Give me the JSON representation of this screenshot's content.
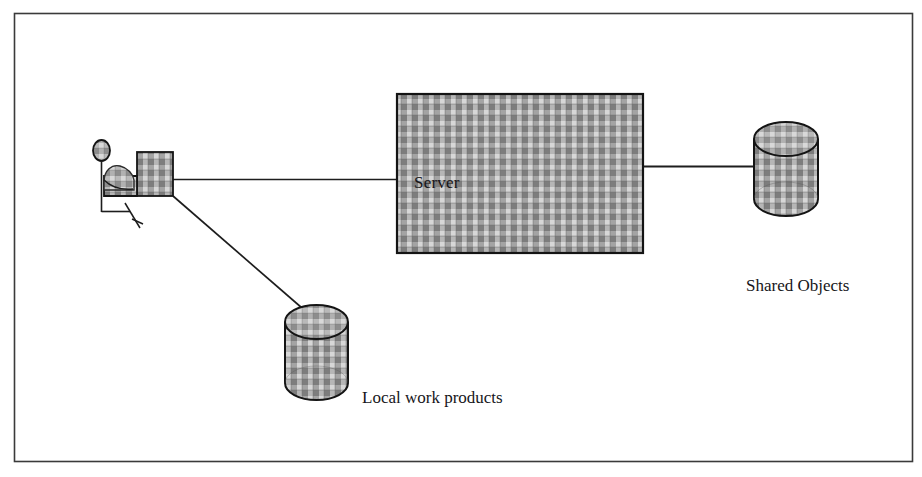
{
  "figure": {
    "type": "architecture-diagram",
    "background_color": "#ffffff",
    "border": {
      "present": true,
      "color": "#3a3a3a",
      "x": 14,
      "y": 13,
      "width": 899,
      "height": 449,
      "stroke_width": 1.6
    }
  },
  "palette": {
    "line_color": "#1d1d1d",
    "text_color": "#16161a",
    "hatch_light": "#c9c9c9",
    "hatch_mid": "#a8a8a8",
    "hatch_dark": "#7a7a7a",
    "shape_outline": "#141414",
    "frame_color": "#3a3a3a"
  },
  "nodes": [
    {
      "id": "workstation",
      "data_name": "workstation-user-figure",
      "kind": "actor-at-workstation",
      "label": "",
      "description": "Seated stick figure person at a desk with a computer terminal",
      "x": 88,
      "y": 140,
      "width": 90,
      "height": 100
    },
    {
      "id": "server",
      "data_name": "server-box",
      "kind": "rectangle",
      "label": "Server",
      "label_x": 414,
      "label_y": 187,
      "x": 397,
      "y": 94,
      "width": 246,
      "height": 159,
      "fill": "hatched-grey-plaid"
    },
    {
      "id": "shared-objects",
      "data_name": "shared-objects-cylinder",
      "kind": "cylinder",
      "label": "Shared Objects",
      "label_x": 746,
      "label_y": 290,
      "x": 754,
      "y": 122,
      "width": 64,
      "height": 94,
      "fill": "hatched-grey-plaid"
    },
    {
      "id": "local-work-products",
      "data_name": "local-work-products-cylinder",
      "kind": "cylinder",
      "label": "Local work products",
      "label_x": 362,
      "label_y": 402,
      "x": 285,
      "y": 305,
      "width": 63,
      "height": 95,
      "fill": "hatched-grey-plaid"
    }
  ],
  "connections": [
    {
      "id": "workstation-to-server",
      "data_name": "connector-workstation-server",
      "from": "workstation",
      "to": "server",
      "style": "solid-line",
      "x1": 172,
      "y1": 179,
      "x2": 397,
      "y2": 179
    },
    {
      "id": "server-to-shared-objects",
      "data_name": "connector-server-shared-objects",
      "from": "server",
      "to": "shared-objects",
      "style": "solid-line",
      "x1": 643,
      "y1": 166,
      "x2": 756,
      "y2": 166
    },
    {
      "id": "workstation-to-local",
      "data_name": "connector-workstation-local-products",
      "from": "workstation",
      "to": "local-work-products",
      "style": "solid-diagonal-line",
      "x1": 173,
      "y1": 196,
      "x2": 316,
      "y2": 320
    }
  ],
  "labels": {
    "server": "Server",
    "shared_objects": "Shared Objects",
    "local_work_products": "Local work products"
  },
  "font_sizes": {
    "server": 17,
    "shared_objects": 17,
    "local_work_products": 17
  }
}
